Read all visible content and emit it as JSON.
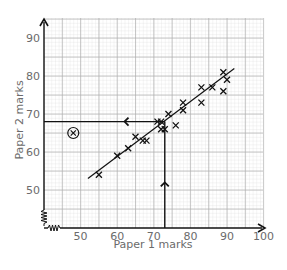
{
  "chart_data": {
    "type": "scatter",
    "title": "",
    "xlabel": "Paper 1 marks",
    "ylabel": "Paper 2 marks",
    "xlim": [
      40,
      100
    ],
    "ylim": [
      40,
      95
    ],
    "x_ticks": [
      50,
      60,
      70,
      80,
      90,
      100
    ],
    "y_ticks": [
      50,
      60,
      70,
      80,
      90
    ],
    "grid": true,
    "axis_breaks": {
      "x": true,
      "y": true
    },
    "points": [
      {
        "x": 55,
        "y": 54
      },
      {
        "x": 60,
        "y": 59
      },
      {
        "x": 63,
        "y": 61
      },
      {
        "x": 65,
        "y": 64
      },
      {
        "x": 67,
        "y": 63
      },
      {
        "x": 68,
        "y": 63
      },
      {
        "x": 71,
        "y": 68
      },
      {
        "x": 72,
        "y": 68
      },
      {
        "x": 72,
        "y": 66
      },
      {
        "x": 73,
        "y": 66
      },
      {
        "x": 74,
        "y": 70
      },
      {
        "x": 76,
        "y": 67
      },
      {
        "x": 78,
        "y": 73
      },
      {
        "x": 78,
        "y": 71
      },
      {
        "x": 83,
        "y": 77
      },
      {
        "x": 83,
        "y": 73
      },
      {
        "x": 86,
        "y": 77
      },
      {
        "x": 89,
        "y": 81
      },
      {
        "x": 90,
        "y": 79
      },
      {
        "x": 89,
        "y": 76
      }
    ],
    "outlier": {
      "x": 48,
      "y": 65,
      "marker": "circled-x"
    },
    "line_of_best_fit": {
      "x1": 52,
      "y1": 53,
      "x2": 92,
      "y2": 82
    },
    "reading_lines": {
      "x_value": 73,
      "y_value": 68
    }
  }
}
